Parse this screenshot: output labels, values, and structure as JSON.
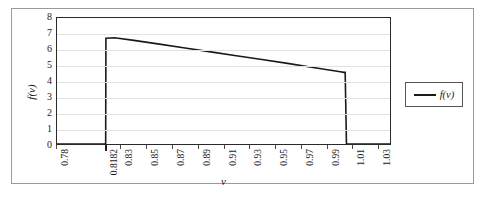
{
  "figure": {
    "background_color": "#ffffff",
    "frame_color": "#9a9a9a",
    "plot_border_color": "#2a2a2a",
    "gridline_color": "#e2e2e2",
    "series_color": "#1a1a1a"
  },
  "chart_data": {
    "type": "line",
    "title": "",
    "xlabel": "v",
    "ylabel": "f(v)",
    "xlim": [
      0.78,
      1.04
    ],
    "ylim": [
      0,
      8
    ],
    "grid": true,
    "grid_axis": "y",
    "legend_position": "right",
    "xtick_labels": [
      "0.78",
      "0.8182",
      "0.83",
      "0.85",
      "0.87",
      "0.89",
      "0.91",
      "0.93",
      "0.95",
      "0.97",
      "0.99",
      "1.01",
      "1.03"
    ],
    "xtick_values": [
      0.78,
      0.8182,
      0.83,
      0.85,
      0.87,
      0.89,
      0.91,
      0.93,
      0.95,
      0.97,
      0.99,
      1.01,
      1.03
    ],
    "ytick_labels": [
      "0",
      "1",
      "2",
      "3",
      "4",
      "5",
      "6",
      "7",
      "8"
    ],
    "ytick_values": [
      0,
      1,
      2,
      3,
      4,
      5,
      6,
      7,
      8
    ],
    "series": [
      {
        "name": "f(v)",
        "color": "#1a1a1a",
        "x": [
          0.78,
          0.818,
          0.8182,
          0.825,
          0.84,
          0.86,
          0.88,
          0.9,
          0.92,
          0.94,
          0.96,
          0.98,
          1.0,
          1.004,
          1.005,
          1.006,
          1.04
        ],
        "y": [
          0.0,
          0.0,
          6.72,
          6.75,
          6.58,
          6.34,
          6.1,
          5.85,
          5.6,
          5.36,
          5.12,
          4.86,
          4.6,
          4.55,
          4.55,
          0.0,
          0.0
        ]
      }
    ]
  },
  "legend": {
    "entries": [
      {
        "label": "f(v)",
        "color": "#1a1a1a"
      }
    ]
  }
}
